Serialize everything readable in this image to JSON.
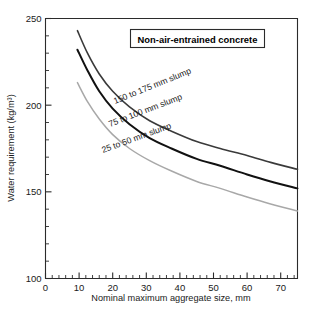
{
  "chart_data": {
    "type": "line",
    "title": "Non-air-entrained concrete",
    "xlabel": "Nominal maximum aggregate size, mm",
    "ylabel": "Water requirement (kg/m³)",
    "xlim": [
      0,
      75
    ],
    "ylim": [
      100,
      250
    ],
    "x_major_ticks": [
      0,
      10,
      20,
      30,
      40,
      50,
      60,
      70
    ],
    "x_major_tick_labels": [
      "0",
      "10",
      "20",
      "30",
      "40",
      "50",
      "60",
      "70"
    ],
    "x_minor_tick_step": 2,
    "y_major_ticks": [
      100,
      150,
      200,
      250
    ],
    "y_major_tick_labels": [
      "100",
      "150",
      "200",
      "250"
    ],
    "y_minor_tick_step": 10,
    "grid": false,
    "legend_position": "inline-curve-labels",
    "annotation_box_position": "top-right-inside",
    "series": [
      {
        "name": "150 to 175 mm slump",
        "color": "#3a3a3a",
        "width": 1.6,
        "x": [
          9.5,
          12.5,
          16,
          20,
          25,
          31,
          37.5,
          45,
          52,
          60,
          67,
          75
        ],
        "values": [
          243,
          230,
          218,
          208,
          199,
          191,
          185,
          179,
          175,
          171,
          167,
          163
        ]
      },
      {
        "name": "75 to 100 mm slump",
        "color": "#111111",
        "width": 2.0,
        "x": [
          9.5,
          12.5,
          16,
          20,
          25,
          31,
          37.5,
          45,
          52,
          60,
          67,
          75
        ],
        "values": [
          232,
          220,
          208,
          198,
          189,
          181,
          175,
          169,
          165,
          160,
          156,
          152
        ]
      },
      {
        "name": "25 to 50 mm slump",
        "color": "#a8a8a8",
        "width": 1.5,
        "x": [
          9.5,
          12.5,
          16,
          20,
          25,
          31,
          37.5,
          45,
          52,
          60,
          67,
          75
        ],
        "values": [
          213,
          202,
          192,
          183,
          175,
          168,
          162,
          156,
          152,
          147,
          143,
          139
        ]
      }
    ],
    "curve_labels": [
      {
        "text": "150 to 175 mm slump",
        "x": 115,
        "y": 104,
        "rotate": -22
      },
      {
        "text": "75 to 100 mm slump",
        "x": 110,
        "y": 127,
        "rotate": -21
      },
      {
        "text": "25 to 50 mm slump",
        "x": 103,
        "y": 153,
        "rotate": -20
      }
    ]
  }
}
